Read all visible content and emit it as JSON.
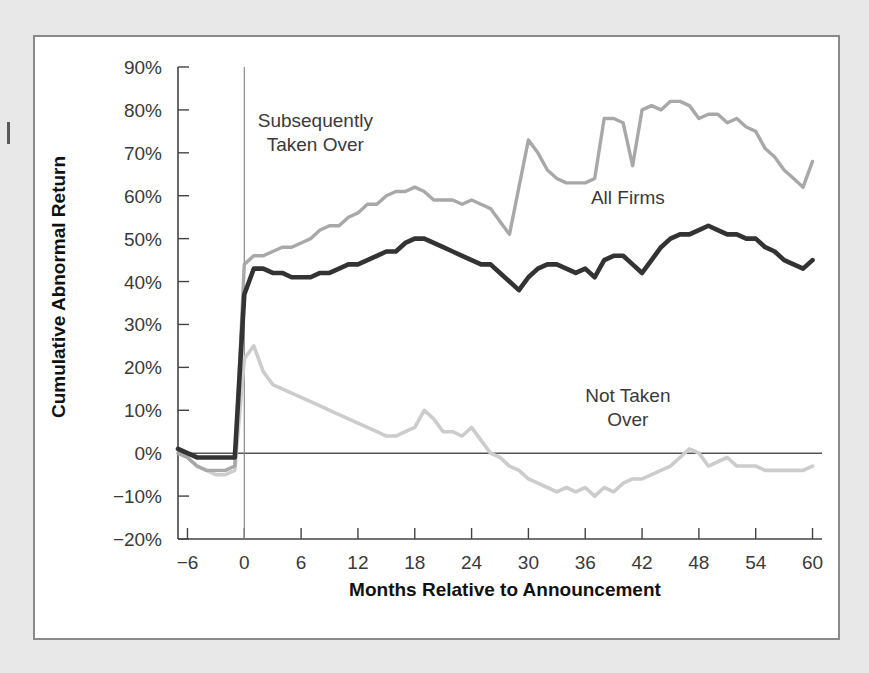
{
  "chart_data": {
    "type": "line",
    "title": "",
    "xlabel": "Months Relative to Announcement",
    "ylabel": "Cumulative Abnormal Return",
    "xlim": [
      -7,
      61
    ],
    "ylim": [
      -20,
      90
    ],
    "xticks": [
      -6,
      0,
      6,
      12,
      18,
      24,
      30,
      36,
      42,
      48,
      54,
      60
    ],
    "xtick_labels": [
      "−6",
      "0",
      "6",
      "12",
      "18",
      "24",
      "30",
      "36",
      "42",
      "48",
      "54",
      "60"
    ],
    "yticks": [
      -20,
      -10,
      0,
      10,
      20,
      30,
      40,
      50,
      60,
      70,
      80,
      90
    ],
    "ytick_labels": [
      "−20%",
      "−10%",
      "0%",
      "10%",
      "20%",
      "30%",
      "40%",
      "50%",
      "60%",
      "70%",
      "80%",
      "90%"
    ],
    "grid": false,
    "legend_position": "inline-annotations",
    "zero_reference_line": 0,
    "event_line_x": 0,
    "x": [
      -7,
      -6,
      -5,
      -4,
      -3,
      -2,
      -1,
      0,
      1,
      2,
      3,
      4,
      5,
      6,
      7,
      8,
      9,
      10,
      11,
      12,
      13,
      14,
      15,
      16,
      17,
      18,
      19,
      20,
      21,
      22,
      23,
      24,
      25,
      26,
      27,
      28,
      29,
      30,
      31,
      32,
      33,
      34,
      35,
      36,
      37,
      38,
      39,
      40,
      41,
      42,
      43,
      44,
      45,
      46,
      47,
      48,
      49,
      50,
      51,
      52,
      53,
      54,
      55,
      56,
      57,
      58,
      59,
      60
    ],
    "series": [
      {
        "name": "Subsequently Taken Over",
        "color": "#a8a8a8",
        "values": [
          0,
          -1,
          -3,
          -4,
          -4,
          -4,
          -3,
          44,
          46,
          46,
          47,
          48,
          48,
          49,
          50,
          52,
          53,
          53,
          55,
          56,
          58,
          58,
          60,
          61,
          61,
          62,
          61,
          59,
          59,
          59,
          58,
          59,
          58,
          57,
          54,
          51,
          62,
          73,
          70,
          66,
          64,
          63,
          63,
          63,
          64,
          78,
          78,
          77,
          67,
          80,
          81,
          80,
          82,
          82,
          81,
          78,
          79,
          79,
          77,
          78,
          76,
          75,
          71,
          69,
          66,
          64,
          62,
          68
        ]
      },
      {
        "name": "All Firms",
        "color": "#333333",
        "values": [
          1,
          0,
          -1,
          -1,
          -1,
          -1,
          -1,
          37,
          43,
          43,
          42,
          42,
          41,
          41,
          41,
          42,
          42,
          43,
          44,
          44,
          45,
          46,
          47,
          47,
          49,
          50,
          50,
          49,
          48,
          47,
          46,
          45,
          44,
          44,
          42,
          40,
          38,
          41,
          43,
          44,
          44,
          43,
          42,
          43,
          41,
          45,
          46,
          46,
          44,
          42,
          45,
          48,
          50,
          51,
          51,
          52,
          53,
          52,
          51,
          51,
          50,
          50,
          48,
          47,
          45,
          44,
          43,
          45
        ]
      },
      {
        "name": "Not Taken Over",
        "color": "#cccccc",
        "values": [
          0,
          -1,
          -3,
          -4,
          -5,
          -5,
          -4,
          22,
          25,
          19,
          16,
          15,
          14,
          13,
          12,
          11,
          10,
          9,
          8,
          7,
          6,
          5,
          4,
          4,
          5,
          6,
          10,
          8,
          5,
          5,
          4,
          6,
          3,
          0,
          -1,
          -3,
          -4,
          -6,
          -7,
          -8,
          -9,
          -8,
          -9,
          -8,
          -10,
          -8,
          -9,
          -7,
          -6,
          -6,
          -5,
          -4,
          -3,
          -1,
          1,
          0,
          -3,
          -2,
          -1,
          -3,
          -3,
          -3,
          -4,
          -4,
          -4,
          -4,
          -4,
          -3
        ]
      }
    ],
    "annotations": [
      {
        "text_line1": "Subsequently",
        "text_line2": "Taken Over",
        "x": 7.5,
        "y": 76
      },
      {
        "text_line1": "All Firms",
        "text_line2": "",
        "x": 40.5,
        "y": 58
      },
      {
        "text_line1": "Not Taken",
        "text_line2": "Over",
        "x": 40.5,
        "y": 12
      }
    ]
  }
}
